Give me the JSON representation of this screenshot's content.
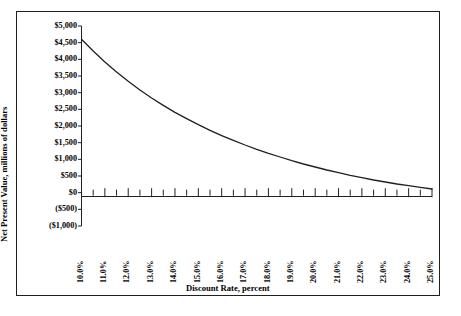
{
  "chart_data": {
    "type": "line",
    "title": "",
    "xlabel": "Discount Rate, percent",
    "ylabel": "Net Present Value, millions of dollars",
    "grid": false,
    "legend": "none",
    "xlim": [
      10.0,
      25.0
    ],
    "ylim": [
      -1000,
      5000
    ],
    "x_tick_labels": [
      "10.0%",
      "11.0%",
      "12.0%",
      "13.0%",
      "14.0%",
      "15.0%",
      "16.0%",
      "17.0%",
      "18.0%",
      "19.0%",
      "20.0%",
      "21.0%",
      "22.0%",
      "23.0%",
      "24.0%",
      "25.0%"
    ],
    "y_tick_labels": [
      "$5,000",
      "$4,500",
      "$4,000",
      "$3,500",
      "$3,000",
      "$2,500",
      "$2,000",
      "$1,500",
      "$1,000",
      "$500",
      "$0",
      "($500)",
      "($1,000)"
    ],
    "y_tick_values": [
      5000,
      4500,
      4000,
      3500,
      3000,
      2500,
      2000,
      1500,
      1000,
      500,
      0,
      -500,
      -1000
    ],
    "series": [
      {
        "name": "Net Present Value",
        "color": "#231f20",
        "x": [
          10.0,
          10.5,
          11.0,
          11.5,
          12.0,
          12.5,
          13.0,
          13.5,
          14.0,
          14.5,
          15.0,
          15.5,
          16.0,
          16.5,
          17.0,
          17.5,
          18.0,
          18.5,
          19.0,
          19.5,
          20.0,
          20.5,
          21.0,
          21.5,
          22.0,
          22.5,
          23.0,
          23.5,
          24.0,
          24.5,
          25.0
        ],
        "values": [
          4600,
          4250,
          3920,
          3620,
          3340,
          3080,
          2840,
          2620,
          2410,
          2220,
          2040,
          1870,
          1710,
          1570,
          1430,
          1300,
          1180,
          1070,
          960,
          860,
          770,
          680,
          600,
          520,
          450,
          380,
          320,
          260,
          210,
          160,
          110
        ]
      }
    ],
    "zero_crossing_percent": 19.0,
    "axis_color": "#231f20",
    "frame_color": "#231f20"
  }
}
